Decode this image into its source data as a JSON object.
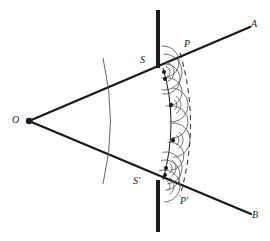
{
  "figure": {
    "background_color": "#ffffff",
    "ink_color": "#1a1a1a",
    "wavelet_color": "#555555",
    "width": 270,
    "height": 241,
    "labels": [
      {
        "id": "O",
        "text": "O",
        "x": 18,
        "y": 120,
        "role": "point-source"
      },
      {
        "id": "A",
        "text": "A",
        "x": 255,
        "y": 24,
        "role": "ray-end-upper"
      },
      {
        "id": "B",
        "text": "B",
        "x": 256,
        "y": 215,
        "role": "ray-end-lower"
      },
      {
        "id": "S",
        "text": "S",
        "x": 144,
        "y": 60,
        "role": "wavefront-upper-edge"
      },
      {
        "id": "S'",
        "text": "S'",
        "x": 138,
        "y": 181,
        "role": "wavefront-lower-edge"
      },
      {
        "id": "P",
        "text": "P",
        "x": 188,
        "y": 44,
        "role": "new-wavefront-upper-edge"
      },
      {
        "id": "P'",
        "text": "P'",
        "x": 185,
        "y": 201,
        "role": "new-wavefront-lower-edge"
      }
    ],
    "source_point": {
      "x": 29,
      "y": 121,
      "radius": 3.2
    },
    "rays": [
      {
        "id": "ray-OA",
        "from": [
          29,
          121
        ],
        "to": [
          250,
          27
        ],
        "label": "A"
      },
      {
        "id": "ray-OB",
        "from": [
          29,
          121
        ],
        "to": [
          251,
          214
        ],
        "label": "B"
      }
    ],
    "barrier": {
      "x": 156,
      "width": 4,
      "upper_segment": {
        "y_top": 10,
        "y_bottom": 68
      },
      "lower_segment": {
        "y_top": 180,
        "y_bottom": 232
      }
    },
    "incident_wavefront": {
      "id": "arc-incident",
      "path": "M 103 58 Q 118 121 103 184",
      "stroke_width": 0.9
    },
    "primary_wavefront": {
      "id": "arc-SS-prime",
      "from_label": "S",
      "to_label": "S'",
      "path": "M 163 68 Q 179 122 163 180",
      "stroke_width": 1.0
    },
    "new_wavefront_envelope": {
      "id": "arc-PP-prime-envelope",
      "from_label": "P",
      "to_label": "P'",
      "path": "M 180 53 Q 201 123 180 196",
      "dashed": true,
      "dash_pattern": "5 4",
      "stroke_width": 1.1
    },
    "wavelet_centers": [
      {
        "x": 164,
        "y": 72,
        "radius": 2.0
      },
      {
        "x": 165,
        "y": 79,
        "radius": 2.0
      },
      {
        "x": 171,
        "y": 105,
        "radius": 2.2
      },
      {
        "x": 173,
        "y": 140,
        "radius": 2.2
      },
      {
        "x": 166,
        "y": 168,
        "radius": 2.0
      },
      {
        "x": 165,
        "y": 175,
        "radius": 2.0
      }
    ],
    "wavelets": [
      {
        "cx": 163,
        "cy": 62,
        "r": 16,
        "a0": -95,
        "a1": 95
      },
      {
        "cx": 164,
        "cy": 72,
        "r": 18,
        "a0": -92,
        "a1": 98
      },
      {
        "cx": 165,
        "cy": 79,
        "r": 15,
        "a0": -90,
        "a1": 100
      },
      {
        "cx": 168,
        "cy": 92,
        "r": 14,
        "a0": -88,
        "a1": 100
      },
      {
        "cx": 171,
        "cy": 105,
        "r": 17,
        "a0": -85,
        "a1": 95
      },
      {
        "cx": 172,
        "cy": 122,
        "r": 16,
        "a0": -85,
        "a1": 90
      },
      {
        "cx": 173,
        "cy": 140,
        "r": 17,
        "a0": -92,
        "a1": 88
      },
      {
        "cx": 170,
        "cy": 156,
        "r": 14,
        "a0": -100,
        "a1": 85
      },
      {
        "cx": 166,
        "cy": 168,
        "r": 16,
        "a0": -102,
        "a1": 85
      },
      {
        "cx": 165,
        "cy": 175,
        "r": 15,
        "a0": -105,
        "a1": 88
      },
      {
        "cx": 164,
        "cy": 186,
        "r": 16,
        "a0": -108,
        "a1": 90
      }
    ],
    "wavelet_short_arcs": [
      {
        "cx": 164,
        "cy": 72,
        "r": 10,
        "a0": -70,
        "a1": 70
      },
      {
        "cx": 164,
        "cy": 72,
        "r": 6,
        "a0": -70,
        "a1": 70
      },
      {
        "cx": 171,
        "cy": 105,
        "r": 10,
        "a0": -60,
        "a1": 60
      },
      {
        "cx": 171,
        "cy": 105,
        "r": 6,
        "a0": -60,
        "a1": 60
      },
      {
        "cx": 173,
        "cy": 140,
        "r": 10,
        "a0": -55,
        "a1": 55
      },
      {
        "cx": 173,
        "cy": 140,
        "r": 6,
        "a0": -55,
        "a1": 55
      },
      {
        "cx": 166,
        "cy": 168,
        "r": 10,
        "a0": -55,
        "a1": 55
      },
      {
        "cx": 166,
        "cy": 168,
        "r": 6,
        "a0": -55,
        "a1": 55
      },
      {
        "cx": 164,
        "cy": 186,
        "r": 10,
        "a0": -60,
        "a1": 55
      },
      {
        "cx": 164,
        "cy": 186,
        "r": 6,
        "a0": -60,
        "a1": 55
      }
    ]
  }
}
